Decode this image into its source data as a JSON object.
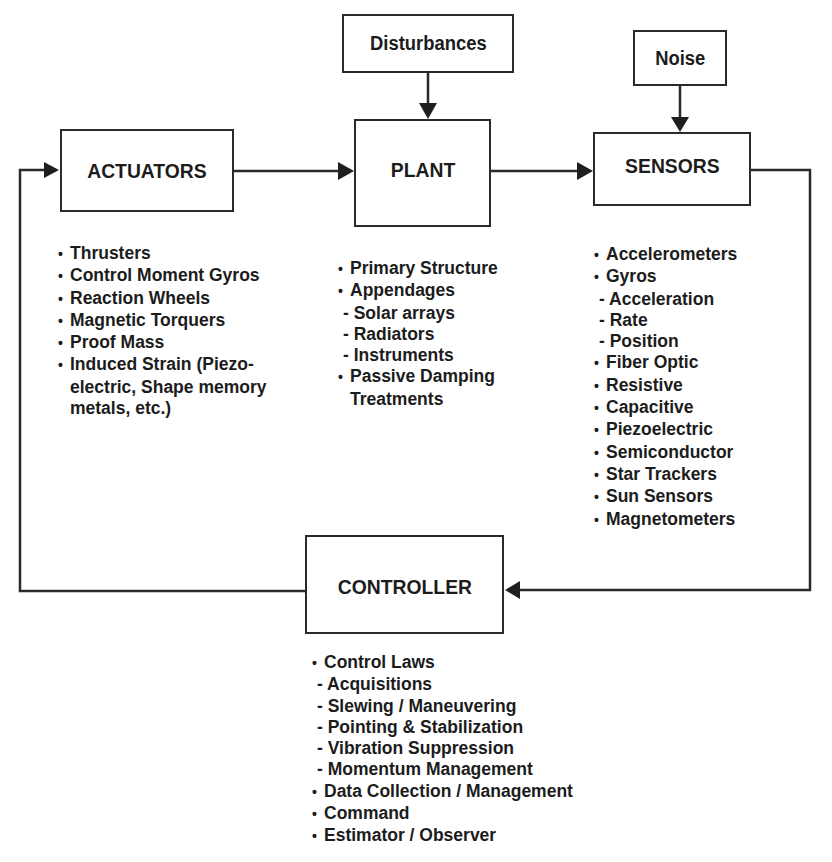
{
  "diagram": {
    "type": "closed-loop control block diagram",
    "blocks": {
      "disturbances": {
        "label": "Disturbances"
      },
      "noise": {
        "label": "Noise"
      },
      "actuators": {
        "label": "ACTUATORS"
      },
      "plant": {
        "label": "PLANT"
      },
      "sensors": {
        "label": "SENSORS"
      },
      "controller": {
        "label": "CONTROLLER"
      }
    },
    "connections": [
      {
        "from": "disturbances",
        "to": "plant"
      },
      {
        "from": "noise",
        "to": "sensors"
      },
      {
        "from": "actuators",
        "to": "plant"
      },
      {
        "from": "plant",
        "to": "sensors"
      },
      {
        "from": "sensors",
        "to": "controller"
      },
      {
        "from": "controller",
        "to": "actuators"
      }
    ],
    "lists": {
      "actuators": [
        {
          "kind": "bullet",
          "text": "Thrusters"
        },
        {
          "kind": "bullet",
          "text": "Control Moment Gyros"
        },
        {
          "kind": "bullet",
          "text": "Reaction Wheels"
        },
        {
          "kind": "bullet",
          "text": "Magnetic Torquers"
        },
        {
          "kind": "bullet",
          "text": "Proof Mass"
        },
        {
          "kind": "bullet",
          "text": "Induced Strain (Piezo-"
        },
        {
          "kind": "cont",
          "text": "electric, Shape memory"
        },
        {
          "kind": "cont",
          "text": "metals, etc.)"
        }
      ],
      "plant": [
        {
          "kind": "bullet",
          "text": "Primary Structure"
        },
        {
          "kind": "bullet",
          "text": "Appendages"
        },
        {
          "kind": "sub",
          "text": "- Solar arrays"
        },
        {
          "kind": "sub",
          "text": "- Radiators"
        },
        {
          "kind": "sub",
          "text": "- Instruments"
        },
        {
          "kind": "bullet",
          "text": "Passive Damping"
        },
        {
          "kind": "cont",
          "text": "Treatments"
        }
      ],
      "sensors": [
        {
          "kind": "bullet",
          "text": "Accelerometers"
        },
        {
          "kind": "bullet",
          "text": "Gyros"
        },
        {
          "kind": "sub",
          "text": "- Acceleration"
        },
        {
          "kind": "sub",
          "text": "- Rate"
        },
        {
          "kind": "sub",
          "text": "- Position"
        },
        {
          "kind": "bullet",
          "text": "Fiber Optic"
        },
        {
          "kind": "bullet",
          "text": "Resistive"
        },
        {
          "kind": "bullet",
          "text": "Capacitive"
        },
        {
          "kind": "bullet",
          "text": "Piezoelectric"
        },
        {
          "kind": "bullet",
          "text": "Semiconductor"
        },
        {
          "kind": "bullet",
          "text": "Star Trackers"
        },
        {
          "kind": "bullet",
          "text": "Sun Sensors"
        },
        {
          "kind": "bullet",
          "text": "Magnetometers"
        }
      ],
      "controller": [
        {
          "kind": "bullet",
          "text": "Control Laws"
        },
        {
          "kind": "sub",
          "text": "- Acquisitions"
        },
        {
          "kind": "sub",
          "text": "- Slewing / Maneuvering"
        },
        {
          "kind": "sub",
          "text": "- Pointing & Stabilization"
        },
        {
          "kind": "sub",
          "text": "- Vibration Suppression"
        },
        {
          "kind": "sub",
          "text": "- Momentum Management"
        },
        {
          "kind": "bullet",
          "text": "Data Collection / Management"
        },
        {
          "kind": "bullet",
          "text": "Command"
        },
        {
          "kind": "bullet",
          "text": "Estimator / Observer"
        }
      ]
    },
    "colors": {
      "ink": "#1c1c1c",
      "background": "#ffffff"
    }
  }
}
